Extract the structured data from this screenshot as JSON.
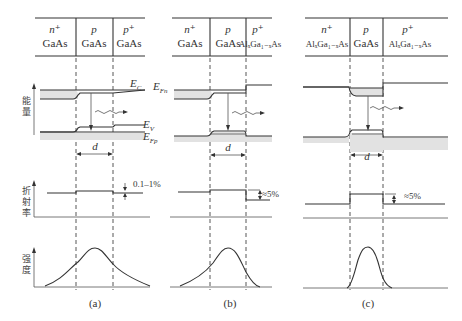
{
  "figure": {
    "panels": [
      {
        "id": "a",
        "caption": "(a)",
        "layers": [
          {
            "doping": "n⁺",
            "material": "GaAs"
          },
          {
            "doping": "p",
            "material": "GaAs"
          },
          {
            "doping": "p⁺",
            "material": "GaAs"
          }
        ],
        "band_labels": {
          "ec": "E",
          "ec_sub": "C",
          "ev": "E",
          "ev_sub": "V",
          "efp": "E",
          "efp_sub": "Fp"
        },
        "thickness_label": "d",
        "index_step_label": "0.1–1%"
      },
      {
        "id": "b",
        "caption": "(b)",
        "layers": [
          {
            "doping": "n⁺",
            "material": "GaAs"
          },
          {
            "doping": "p",
            "material": "GaAs"
          },
          {
            "doping": "p⁺",
            "material": "AlₓGa₁₋ₓAs"
          }
        ],
        "band_labels": {
          "efn": "E",
          "efn_sub": "Fn"
        },
        "thickness_label": "d",
        "index_step_label": "≈5%"
      },
      {
        "id": "c",
        "caption": "(c)",
        "layers": [
          {
            "doping": "n⁺",
            "material": "AlₓGa₁₋ₓAs"
          },
          {
            "doping": "p",
            "material": "GaAs"
          },
          {
            "doping": "p⁺",
            "material": "AlₓGa₁₋ₓAs"
          }
        ],
        "thickness_label": "d",
        "index_step_label": "≈5%"
      }
    ],
    "axis_labels": {
      "energy": "能量",
      "refractive_index": "折射率",
      "intensity": "强度"
    }
  }
}
